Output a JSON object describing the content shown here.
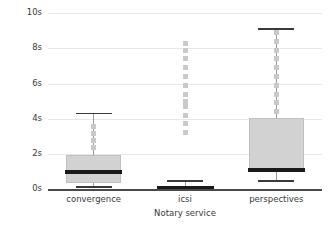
{
  "chart_data": {
    "type": "box",
    "title": "",
    "xlabel": "Notary service",
    "ylabel": "Response Time in seconds",
    "categories": [
      "convergence",
      "icsi",
      "perspectives"
    ],
    "ytick_labels": [
      "0s",
      "2s",
      "4s",
      "6s",
      "8s",
      "10s"
    ],
    "ytick_values": [
      0,
      2,
      4,
      6,
      8,
      10
    ],
    "ylim": [
      0,
      10.3
    ],
    "grid": true,
    "legend": null,
    "boxes": [
      {
        "name": "convergence",
        "whisker_low": 0.15,
        "q1": 0.35,
        "median": 0.95,
        "q3": 1.95,
        "whisker_high": 4.35,
        "outliers": [
          2.35,
          2.75,
          3.15,
          3.55
        ]
      },
      {
        "name": "icsi",
        "whisker_low": 0.0,
        "q1": 0.0,
        "median": 0.05,
        "q3": 0.1,
        "whisker_high": 0.5,
        "outliers": [
          3.2,
          3.7,
          4.2,
          4.7,
          5.0,
          5.4,
          5.9,
          6.4,
          6.9,
          7.4,
          7.9,
          8.3
        ]
      },
      {
        "name": "perspectives",
        "whisker_low": 0.5,
        "q1": 0.95,
        "median": 1.1,
        "q3": 4.05,
        "whisker_high": 9.15,
        "outliers": [
          4.4,
          4.9,
          5.4,
          5.9,
          6.4,
          6.9,
          7.4,
          7.9,
          8.4,
          8.9
        ]
      }
    ],
    "colors": {
      "box_fill": "#d2d2d2",
      "box_edge": "#c0c0c0",
      "median": "#1a1a1a",
      "whisker": "#9a9a9a",
      "outlier": "#c9c9c9",
      "grid": "#e8e8e8",
      "axis": "#4a4a4a",
      "text": "#3a3a3a",
      "background": "#ffffff"
    }
  }
}
